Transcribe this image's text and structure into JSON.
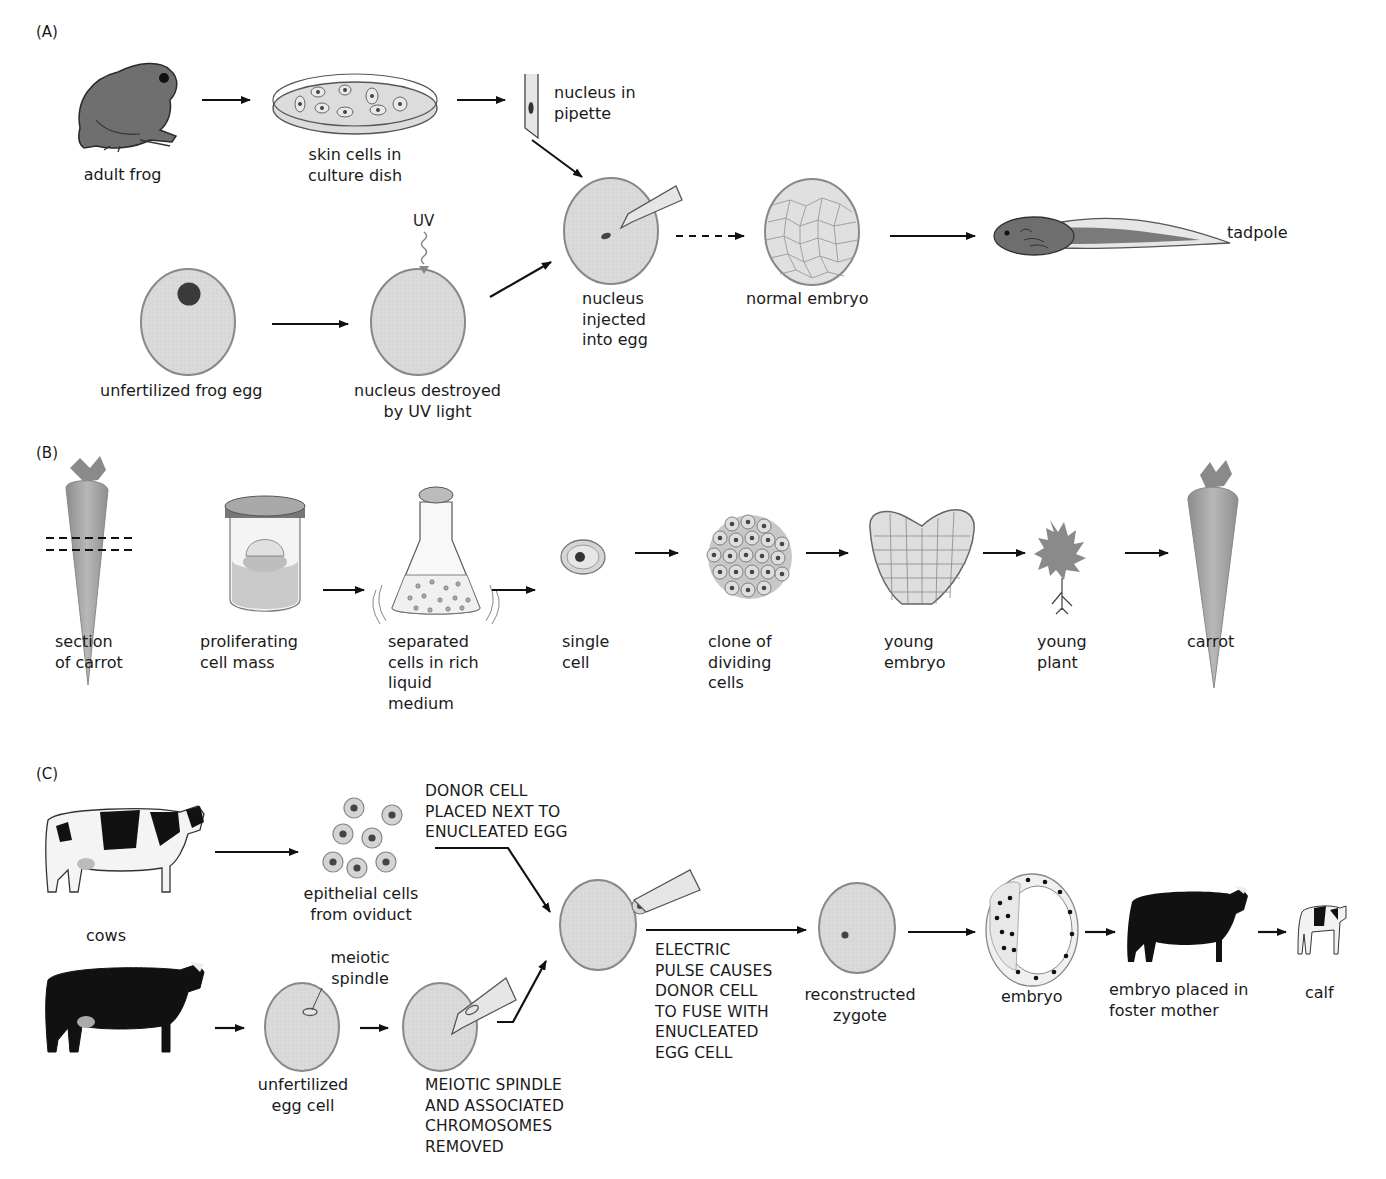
{
  "panels": {
    "A": {
      "tag": "(A)",
      "labels": {
        "adult_frog": "adult frog",
        "skin_cells": "skin cells in\nculture dish",
        "nucleus_pipette": "nucleus in\npipette",
        "uv": "UV",
        "unfertilized_egg": "unfertilized frog egg",
        "nucleus_destroyed": "nucleus destroyed\nby UV light",
        "nucleus_injected": "nucleus\ninjected\ninto egg",
        "normal_embryo": "normal embryo",
        "tadpole": "tadpole"
      }
    },
    "B": {
      "tag": "(B)",
      "labels": {
        "section_carrot": "section\nof carrot",
        "proliferating": "proliferating\ncell mass",
        "separated": "separated\ncells in rich\nliquid\nmedium",
        "single_cell": "single\ncell",
        "clone": "clone of\ndividing\ncells",
        "young_embryo": "young\nembryo",
        "young_plant": "young\nplant",
        "carrot": "carrot"
      }
    },
    "C": {
      "tag": "(C)",
      "labels": {
        "cows": "cows",
        "epithelial": "epithelial cells\nfrom oviduct",
        "donor_placed": "DONOR CELL\nPLACED NEXT TO\nENUCLEATED EGG",
        "meiotic_spindle": "meiotic\nspindle",
        "unfertilized_egg_cell": "unfertilized\negg cell",
        "spindle_removed": "MEIOTIC SPINDLE\nAND ASSOCIATED\nCHROMOSOMES\nREMOVED",
        "electric_pulse": "ELECTRIC\nPULSE CAUSES\nDONOR CELL\nTO FUSE WITH\nENUCLEATED\nEGG CELL",
        "reconstructed": "reconstructed\nzygote",
        "embryo": "embryo",
        "foster": "embryo placed in\nfoster mother",
        "calf": "calf"
      }
    }
  },
  "colors": {
    "cell_fill": "#d9d9d9",
    "cell_stroke": "#8a8a8a",
    "nucleus": "#3a3a3a",
    "frog": "#6e6e6e",
    "carrot": "#a8a8a8",
    "cow_black": "#111111",
    "arrow": "#111111"
  }
}
